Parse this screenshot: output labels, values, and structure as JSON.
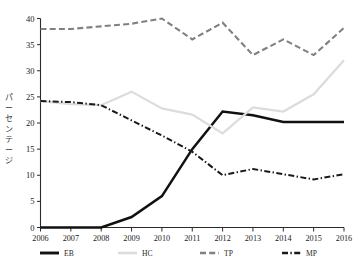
{
  "chart_data": {
    "type": "line",
    "title": "",
    "xlabel": "",
    "ylabel": "パーセンテージ",
    "x": [
      2006,
      2007,
      2008,
      2009,
      2010,
      2011,
      2012,
      2013,
      2014,
      2015,
      2016
    ],
    "xtick_labels": [
      "2006",
      "2007",
      "2008",
      "2009",
      "2010",
      "2011",
      "2012",
      "2013",
      "2014",
      "2015",
      "2016"
    ],
    "ytick_labels": [
      "0",
      "5",
      "10",
      "15",
      "20",
      "25",
      "30",
      "35",
      "40"
    ],
    "ylim": [
      0,
      40
    ],
    "xlim": [
      2006,
      2016
    ],
    "grid": false,
    "legend_position": "bottom",
    "series": [
      {
        "name": "EB",
        "values": [
          0,
          0,
          0,
          2,
          6,
          15,
          22.2,
          21.5,
          20.2,
          20.2,
          20.2
        ],
        "color": "#111111",
        "style": "solid"
      },
      {
        "name": "HC",
        "values": [
          24.2,
          23.6,
          23.4,
          26,
          22.8,
          21.6,
          18,
          23,
          22.2,
          25.5,
          32
        ],
        "color": "#dcdcdc",
        "style": "solid"
      },
      {
        "name": "TP",
        "values": [
          38,
          38,
          38.5,
          39,
          40,
          36,
          39.2,
          33,
          36,
          33,
          38.2
        ],
        "color": "#808080",
        "style": "dashed"
      },
      {
        "name": "MP",
        "values": [
          24.2,
          24,
          23.4,
          20.5,
          17.6,
          14.5,
          10,
          11.2,
          10.2,
          9.2,
          10.2
        ],
        "color": "#1a1a1a",
        "style": "dashdot"
      }
    ]
  },
  "legend": {
    "items": [
      {
        "label": "EB",
        "color": "#111111",
        "style": "solid"
      },
      {
        "label": "HC",
        "color": "#dcdcdc",
        "style": "solid"
      },
      {
        "label": "TP",
        "color": "#808080",
        "style": "dashed"
      },
      {
        "label": "MP",
        "color": "#1a1a1a",
        "style": "dashdot"
      }
    ]
  },
  "axis": {
    "y_title_chars": [
      "パ",
      "ー",
      "セ",
      "ン",
      "テ",
      "ー",
      "ジ"
    ]
  }
}
